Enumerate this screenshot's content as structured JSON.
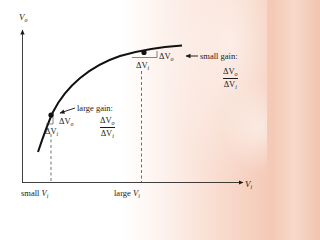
{
  "diagram": {
    "type": "transfer-curve",
    "colors": {
      "ink": "#1a1a1a",
      "background_tint": "#f4c9b6"
    },
    "axes": {
      "y_label": {
        "main": "V",
        "sub": "o"
      },
      "x_label": {
        "main": "V",
        "sub": "i"
      }
    },
    "x_ticks": [
      {
        "prefix": "small ",
        "main": "V",
        "sub": "i"
      },
      {
        "prefix": "large ",
        "main": "V",
        "sub": "i"
      }
    ],
    "points": [
      {
        "id": "small-input-point",
        "gain_label": "large gain:",
        "delta_out": {
          "symbol": "ΔV",
          "sub": "o"
        },
        "delta_in": {
          "symbol": "ΔV",
          "sub": "i"
        },
        "ratio": {
          "num": "ΔV",
          "num_sub": "o",
          "den": "ΔV",
          "den_sub": "i"
        }
      },
      {
        "id": "large-input-point",
        "gain_label": "small gain:",
        "delta_out": {
          "symbol": "ΔV",
          "sub": "o"
        },
        "delta_in": {
          "symbol": "ΔV",
          "sub": "i"
        },
        "ratio": {
          "num": "ΔV",
          "num_sub": "o",
          "den": "ΔV",
          "den_sub": "i"
        }
      }
    ]
  }
}
